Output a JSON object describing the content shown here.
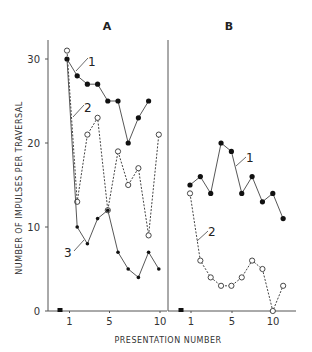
{
  "chart_data": {
    "type": "line",
    "ylabel": "NUMBER OF IMPULSES PER TRAVERSAL",
    "xlabel": "PRESENTATION NUMBER",
    "ylim": [
      0,
      32
    ],
    "yticks": [
      0,
      10,
      20,
      30
    ],
    "xticks": [
      1,
      5,
      10
    ],
    "grid": false,
    "legend": "inline curve labels (1, 2, 3)",
    "panels": [
      {
        "title": "A",
        "baseline_marker": {
          "x": 0,
          "y": 0,
          "shape": "filled-square"
        },
        "series": [
          {
            "name": "1",
            "style": "solid",
            "marker": "filled-circle",
            "x": [
              1,
              2,
              3,
              4,
              5,
              6,
              7,
              8,
              9
            ],
            "values": [
              30,
              28,
              27,
              27,
              25,
              25,
              20,
              23,
              25
            ]
          },
          {
            "name": "2",
            "style": "dashed",
            "marker": "open-circle",
            "x": [
              1,
              2,
              3,
              4,
              5,
              6,
              7,
              8,
              9,
              10
            ],
            "values": [
              31,
              13,
              21,
              23,
              12,
              19,
              15,
              17,
              9,
              21
            ]
          },
          {
            "name": "3",
            "style": "solid",
            "marker": "filled-small",
            "x": [
              1,
              2,
              3,
              4,
              5,
              6,
              7,
              8,
              9,
              10
            ],
            "values": [
              30,
              10,
              8,
              11,
              12,
              7,
              5,
              4,
              7,
              5
            ]
          }
        ]
      },
      {
        "title": "B",
        "baseline_marker": {
          "x": 0,
          "y": 0,
          "shape": "filled-square"
        },
        "series": [
          {
            "name": "1",
            "style": "solid",
            "marker": "filled-circle",
            "x": [
              1,
              2,
              3,
              4,
              5,
              6,
              7,
              8,
              9,
              10
            ],
            "values": [
              15,
              16,
              14,
              20,
              19,
              14,
              16,
              13,
              14,
              11
            ]
          },
          {
            "name": "2",
            "style": "dashed",
            "marker": "open-circle",
            "x": [
              1,
              2,
              3,
              4,
              5,
              6,
              7,
              8,
              9,
              10
            ],
            "values": [
              14,
              6,
              4,
              3,
              3,
              4,
              6,
              5,
              0,
              3
            ]
          }
        ]
      }
    ]
  },
  "labels": {
    "panel_a_title": "A",
    "panel_b_title": "B",
    "y_axis": "NUMBER OF IMPULSES PER TRAVERSAL",
    "x_axis": "PRESENTATION NUMBER",
    "ytick_0": "0",
    "ytick_10": "10",
    "ytick_20": "20",
    "ytick_30": "30",
    "xtick_1": "1",
    "xtick_5": "5",
    "xtick_10": "10",
    "a_curve1": "1",
    "a_curve2": "2",
    "a_curve3": "3",
    "b_curve1": "1",
    "b_curve2": "2"
  }
}
